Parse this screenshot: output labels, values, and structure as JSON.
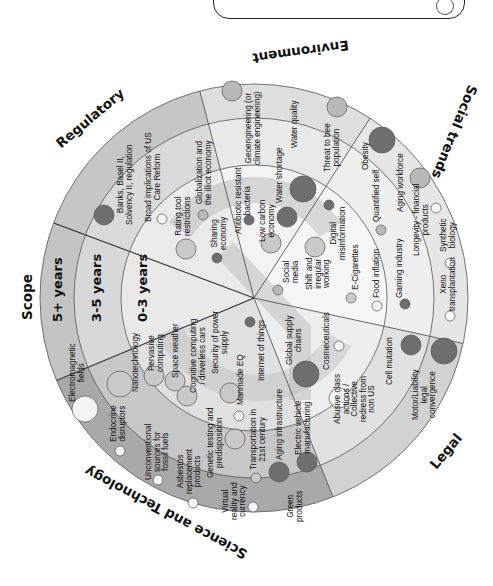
{
  "categories": {
    "scope": "Scope",
    "regulatory": "Regulatory",
    "environment": "Environment",
    "social": "Social trends",
    "legal": "Legal",
    "science": "Science and Technology"
  },
  "rings": {
    "outer": "5+ years",
    "middle": "3-5 years",
    "inner": "0-3 years"
  },
  "colors": {
    "dark_bubble": "#6e6e6e",
    "mid_bubble": "#b9b9b9",
    "light_bubble": "#f4f4f4",
    "reg_outer": "#c4c4c4",
    "reg_mid": "#d6d6d6",
    "env_outer": "#dcdcdc",
    "env_mid": "#ebebeb",
    "sci_outer": "#a9a9a9",
    "sci_mid": "#c9c9c9",
    "legal_outer": "#d0d0d0",
    "social_outer": "#e4e4e4",
    "inner": "#f1f1f1",
    "scope_outer": "#c4c4c4",
    "scope_mid": "#e6e6e6"
  },
  "items": {
    "regulatory": [
      "Banks, Basel II,\nSolvency II, regulation",
      "Broad implications of US\nCare Reform",
      "Globalization and\nthe illicit economy",
      "Rating tool\nrestrictions",
      "Sharing\neconomy"
    ],
    "environment": [
      "Geoengineering (or\nclimate engineering)",
      "Water quality",
      "Threat to bee\npopulation",
      "Antibiotic resistant\nbacteria",
      "Water shortage",
      "Low carbon\neconomy"
    ],
    "social": [
      "Obesity",
      "Aging workforce",
      "Quantified self",
      "Longevity - financial\nproducts",
      "Synthetic\nbiology",
      "Xeno\ntransplantation",
      "Gaming industry",
      "Food inflation",
      "E-Cigarettes",
      "Digital\nmisinformation",
      "Shift and\nirregular\nworking",
      "Social\nmedia"
    ],
    "legal": [
      "Motor/Liability\nlegal\nconvergence",
      "Cell mutation",
      "Abusive class\nactions /\nCollective\nredress from\nnon US",
      "Cosmeceuticals",
      "Global supply\nchains"
    ],
    "science": [
      "Electromagnetic\nfields",
      "Endocrine\ndisruptors",
      "Unconventional\nsources for\nfossil fuels",
      "Asbestos\nreplacement\nproducts",
      "Virtual\nreality and\ncurrency",
      "Green\nproducts",
      "Nanotechnology",
      "Pervasive\ncomputing",
      "Space weather",
      "Cognitive computing\n/ driverless cars",
      "Security of power\nsupply",
      "Manmade EQ",
      "Internet of things",
      "Genetic testing and\npredisposition",
      "Transportation in\n21st century",
      "Aging infrastructure",
      "Electric vehicle\nmanufacturing"
    ]
  }
}
